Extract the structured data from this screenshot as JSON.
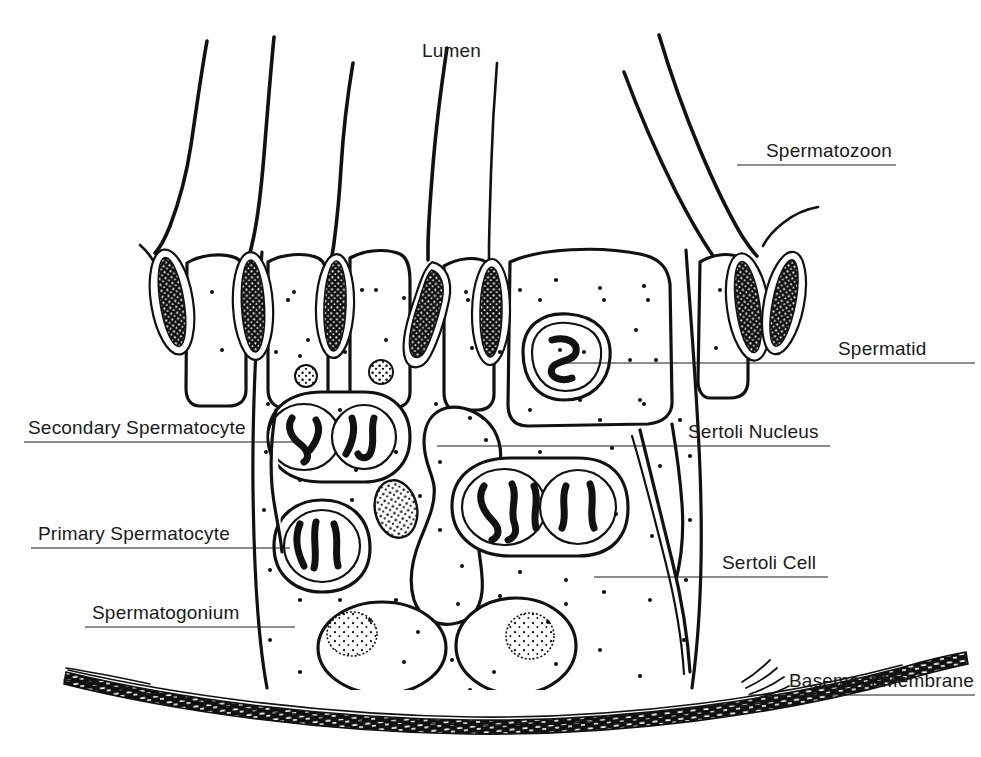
{
  "figure": {
    "background_color": "#ffffff",
    "ink_color": "#111111",
    "width": 981,
    "height": 757
  },
  "labels": {
    "lumen": {
      "text": "Lumen",
      "x": 422,
      "y": 57,
      "anchor": "start",
      "has_leader": false
    },
    "spermatozoon": {
      "text": "Spermatozoon",
      "x": 766,
      "y": 157,
      "anchor": "start",
      "has_leader": true,
      "leader_x1": 737,
      "leader_x2": 896,
      "leader_y": 165
    },
    "spermatid": {
      "text": "Spermatid",
      "x": 838,
      "y": 355,
      "anchor": "start",
      "has_leader": true,
      "leader_x1": 556,
      "leader_x2": 975,
      "leader_y": 363
    },
    "sertoli_nucleus": {
      "text": "Sertoli Nucleus",
      "x": 688,
      "y": 438,
      "anchor": "start",
      "has_leader": true,
      "leader_x1": 437,
      "leader_x2": 830,
      "leader_y": 446
    },
    "sertoli_cell": {
      "text": "Sertoli Cell",
      "x": 722,
      "y": 569,
      "anchor": "start",
      "has_leader": true,
      "leader_x1": 594,
      "leader_x2": 828,
      "leader_y": 577
    },
    "basement_membrane": {
      "text": "Basement Membrane",
      "x": 789,
      "y": 687,
      "anchor": "start",
      "has_leader": true,
      "leader_x1": 748,
      "leader_x2": 975,
      "leader_y": 695
    },
    "secondary_spermatocyte": {
      "text": "Secondary Spermatocyte",
      "x": 28,
      "y": 434,
      "anchor": "start",
      "has_leader": true,
      "leader_x1": 24,
      "leader_x2": 300,
      "leader_y": 442
    },
    "primary_spermatocyte": {
      "text": "Primary Spermatocyte",
      "x": 38,
      "y": 540,
      "anchor": "start",
      "has_leader": true,
      "leader_x1": 31,
      "leader_x2": 290,
      "leader_y": 548
    },
    "spermatogonium": {
      "text": "Spermatogonium",
      "x": 92,
      "y": 619,
      "anchor": "start",
      "has_leader": true,
      "leader_x1": 85,
      "leader_x2": 295,
      "leader_y": 627
    }
  },
  "structures": {
    "spermatozoa_tails": [
      {
        "name": "tail-1",
        "d": "M207 41 C 199 95, 188 165, 172 215 C 166 233, 160 245, 154 252"
      },
      {
        "name": "tail-2",
        "d": "M274 37 C 268 90, 262 150, 258 195 C 255 225, 252 240, 250 250"
      },
      {
        "name": "tail-3",
        "d": "M353 63 C 344 110, 339 160, 336 200 C 333 232, 331 244, 331 252"
      },
      {
        "name": "tail-4",
        "d": "M447 48 C 438 100, 430 160, 428 205 C 426 235, 427 248, 428 256"
      },
      {
        "name": "tail-5",
        "d": "M497 63 C 492 112, 489 165, 489 205 C 489 234, 490 246, 491 254"
      },
      {
        "name": "tail-6",
        "d": "M659 35 C 676 90, 700 155, 725 205 C 740 233, 749 245, 755 252"
      },
      {
        "name": "tail-7",
        "d": "M624 72 C 646 128, 676 190, 706 238 C 722 263, 732 275, 738 282"
      },
      {
        "name": "tail-8",
        "d": "M818 205 C 806 208, 792 214, 781 223 C 772 230, 766 238, 763 245"
      }
    ],
    "spermatid_heads": [
      {
        "name": "head-1",
        "cx": 172,
        "cy": 300,
        "rx": 16,
        "ry": 47,
        "angle": -10
      },
      {
        "name": "head-2",
        "cx": 253,
        "cy": 305,
        "rx": 15,
        "ry": 48,
        "angle": -3
      },
      {
        "name": "head-3",
        "cx": 335,
        "cy": 305,
        "rx": 14,
        "ry": 46,
        "angle": 2
      },
      {
        "name": "head-4",
        "cx": 429,
        "cy": 310,
        "rx": 16,
        "ry": 48,
        "angle": 4
      },
      {
        "name": "head-5",
        "cx": 491,
        "cy": 312,
        "rx": 14,
        "ry": 47,
        "angle": 1
      },
      {
        "name": "head-6",
        "cx": 748,
        "cy": 305,
        "rx": 15,
        "ry": 47,
        "angle": -8
      },
      {
        "name": "head-7",
        "cx": 782,
        "cy": 303,
        "rx": 14,
        "ry": 46,
        "angle": 10
      }
    ],
    "spermatogonia": [
      {
        "name": "spermatogonium-left",
        "cx": 382,
        "cy": 645,
        "rx": 62,
        "ry": 44
      },
      {
        "name": "spermatogonium-right",
        "cx": 512,
        "cy": 640,
        "rx": 58,
        "ry": 46
      }
    ],
    "primary_spermatocytes": [
      {
        "name": "primary-spermatocyte-left",
        "cx": 320,
        "cy": 546,
        "rx": 43,
        "ry": 37
      },
      {
        "name": "primary-spermatocyte-right-a",
        "cx": 500,
        "cy": 507,
        "rx": 45,
        "ry": 38
      },
      {
        "name": "primary-spermatocyte-right-b",
        "cx": 572,
        "cy": 506,
        "rx": 38,
        "ry": 36
      }
    ],
    "secondary_spermatocytes": [
      {
        "name": "secondary-spermatocyte-a",
        "cx": 305,
        "cy": 438,
        "rx": 37,
        "ry": 33
      },
      {
        "name": "secondary-spermatocyte-b",
        "cx": 360,
        "cy": 437,
        "rx": 33,
        "ry": 32
      }
    ],
    "sertoli_nucleus_blob": {
      "name": "sertoli-nucleus",
      "cx": 396,
      "cy": 508,
      "rx": 20,
      "ry": 28
    },
    "small_dark_cells": [
      {
        "name": "small-cell-a",
        "cx": 306,
        "cy": 376,
        "r": 11
      },
      {
        "name": "small-cell-b",
        "cx": 380,
        "cy": 372,
        "r": 12
      }
    ]
  }
}
